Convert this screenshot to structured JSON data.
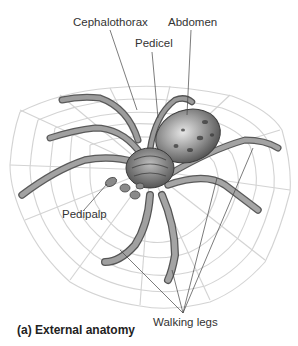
{
  "figure": {
    "caption": "(a) External anatomy"
  },
  "labels": {
    "cephalothorax": "Cephalothorax",
    "abdomen": "Abdomen",
    "pedicel": "Pedicel",
    "pedipalp": "Pedipalp",
    "walking_legs": "Walking legs"
  },
  "colors": {
    "label_text": "#333333",
    "leader_line": "#444444",
    "web": "#c8c8c8",
    "body": "#7a7a7a"
  }
}
